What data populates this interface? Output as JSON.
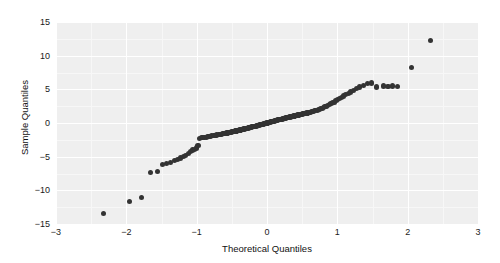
{
  "chart_data": {
    "type": "scatter",
    "title": "",
    "xlabel": "Theoretical Quantiles",
    "ylabel": "Sample Quantiles",
    "xlim": [
      -3,
      3
    ],
    "ylim": [
      -15,
      15
    ],
    "xticks": [
      "-3",
      "-2",
      "-1",
      "0",
      "1",
      "2",
      "3"
    ],
    "xtick_values": [
      -3,
      -2,
      -1,
      0,
      1,
      2,
      3
    ],
    "yticks": [
      "15",
      "10",
      "5",
      "0",
      "-5",
      "-10",
      "-15"
    ],
    "ytick_values": [
      15,
      10,
      5,
      0,
      -5,
      -10,
      -15
    ],
    "grid": true,
    "grid_color": "#ffffff",
    "panel_background": "#efefef",
    "legend": "none",
    "marker_color": "#333333",
    "marker_size": 5,
    "series": [
      {
        "name": "Sample vs Theoretical Quantiles",
        "x": [
          -2.32,
          -1.95,
          -1.79,
          -1.66,
          -1.56,
          -1.49,
          -1.43,
          -1.37,
          -1.32,
          -1.27,
          -1.23,
          -1.19,
          -1.155,
          -1.12,
          -1.09,
          -1.06,
          -1.03,
          -1.005,
          -0.98,
          -0.955,
          -0.93,
          -0.91,
          -0.885,
          -0.865,
          -0.845,
          -0.825,
          -0.805,
          -0.785,
          -0.765,
          -0.75,
          -0.73,
          -0.715,
          -0.695,
          -0.68,
          -0.66,
          -0.645,
          -0.63,
          -0.615,
          -0.6,
          -0.585,
          -0.57,
          -0.555,
          -0.54,
          -0.525,
          -0.51,
          -0.495,
          -0.48,
          -0.465,
          -0.45,
          -0.44,
          -0.425,
          -0.41,
          -0.395,
          -0.385,
          -0.37,
          -0.355,
          -0.345,
          -0.33,
          -0.315,
          -0.305,
          -0.29,
          -0.28,
          -0.265,
          -0.255,
          -0.24,
          -0.23,
          -0.215,
          -0.205,
          -0.19,
          -0.18,
          -0.165,
          -0.155,
          -0.14,
          -0.13,
          -0.12,
          -0.105,
          -0.095,
          -0.08,
          -0.07,
          -0.06,
          -0.045,
          -0.035,
          -0.02,
          -0.01,
          0.0,
          0.01,
          0.02,
          0.035,
          0.045,
          0.06,
          0.07,
          0.08,
          0.095,
          0.105,
          0.12,
          0.13,
          0.14,
          0.155,
          0.165,
          0.18,
          0.19,
          0.205,
          0.215,
          0.23,
          0.24,
          0.255,
          0.265,
          0.28,
          0.29,
          0.305,
          0.315,
          0.33,
          0.345,
          0.355,
          0.37,
          0.385,
          0.395,
          0.41,
          0.425,
          0.44,
          0.45,
          0.465,
          0.48,
          0.495,
          0.51,
          0.525,
          0.54,
          0.555,
          0.57,
          0.585,
          0.6,
          0.615,
          0.63,
          0.645,
          0.66,
          0.68,
          0.695,
          0.715,
          0.73,
          0.75,
          0.765,
          0.785,
          0.805,
          0.825,
          0.845,
          0.865,
          0.885,
          0.91,
          0.93,
          0.955,
          0.98,
          1.005,
          1.03,
          1.06,
          1.09,
          1.12,
          1.155,
          1.19,
          1.23,
          1.27,
          1.32,
          1.37,
          1.43,
          1.49,
          1.56,
          1.66,
          1.72,
          1.79,
          1.86,
          2.05,
          2.33
        ],
        "y": [
          -13.5,
          -11.7,
          -11.1,
          -7.4,
          -7.2,
          -6.2,
          -6.0,
          -5.9,
          -5.6,
          -5.4,
          -5.2,
          -5.0,
          -4.8,
          -4.5,
          -4.2,
          -4.0,
          -3.9,
          -3.7,
          -3.4,
          -2.3,
          -2.2,
          -2.2,
          -2.15,
          -2.1,
          -2.05,
          -2.0,
          -1.95,
          -1.9,
          -1.9,
          -1.85,
          -1.8,
          -1.78,
          -1.75,
          -1.7,
          -1.68,
          -1.65,
          -1.6,
          -1.58,
          -1.55,
          -1.5,
          -1.48,
          -1.45,
          -1.4,
          -1.38,
          -1.35,
          -1.3,
          -1.28,
          -1.25,
          -1.2,
          -1.18,
          -1.15,
          -1.1,
          -1.08,
          -1.05,
          -1.0,
          -0.98,
          -0.95,
          -0.9,
          -0.88,
          -0.85,
          -0.8,
          -0.78,
          -0.75,
          -0.7,
          -0.68,
          -0.65,
          -0.6,
          -0.58,
          -0.55,
          -0.5,
          -0.48,
          -0.45,
          -0.4,
          -0.38,
          -0.35,
          -0.3,
          -0.28,
          -0.25,
          -0.2,
          -0.18,
          -0.15,
          -0.1,
          -0.08,
          -0.04,
          0.0,
          0.04,
          0.08,
          0.1,
          0.15,
          0.18,
          0.2,
          0.25,
          0.28,
          0.3,
          0.35,
          0.38,
          0.4,
          0.45,
          0.48,
          0.5,
          0.55,
          0.58,
          0.6,
          0.65,
          0.68,
          0.7,
          0.75,
          0.78,
          0.8,
          0.85,
          0.88,
          0.9,
          0.95,
          0.98,
          1.0,
          1.05,
          1.08,
          1.1,
          1.15,
          1.18,
          1.2,
          1.25,
          1.28,
          1.3,
          1.35,
          1.38,
          1.4,
          1.45,
          1.48,
          1.5,
          1.55,
          1.6,
          1.65,
          1.7,
          1.75,
          1.8,
          1.85,
          1.9,
          1.95,
          2.0,
          2.1,
          2.2,
          2.3,
          2.4,
          2.5,
          2.6,
          2.7,
          2.85,
          3.0,
          3.1,
          3.3,
          3.45,
          3.6,
          3.8,
          4.0,
          4.2,
          4.4,
          4.6,
          4.85,
          5.1,
          5.35,
          5.6,
          5.85,
          5.95,
          5.35,
          5.5,
          5.4,
          5.5,
          5.45,
          8.3,
          12.2
        ]
      }
    ]
  }
}
